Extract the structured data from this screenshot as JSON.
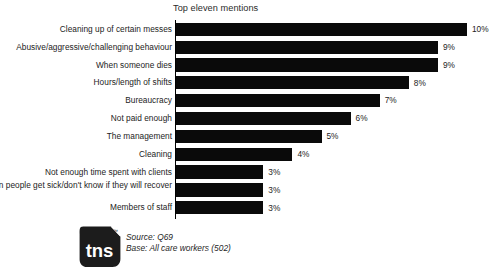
{
  "chart_data": {
    "type": "bar",
    "orientation": "horizontal",
    "title": "Top eleven mentions",
    "xlabel": "",
    "ylabel": "",
    "xlim": [
      0,
      11
    ],
    "grid": false,
    "legend": null,
    "value_suffix": "%",
    "bar_color": "#0a0a0a",
    "categories": [
      "Cleaning up of certain messes",
      "Abusive/aggressive/challenging behaviour",
      "When someone dies",
      "Hours/length of shifts",
      "Bureaucracy",
      "Not paid enough",
      "The management",
      "Cleaning",
      "Not enough time spent with clients",
      "When people get sick/don't know if they will recover",
      "Members of staff"
    ],
    "values": [
      10,
      9,
      9,
      8,
      7,
      6,
      5,
      4,
      3,
      3,
      3
    ],
    "value_labels": [
      "10%",
      "9%",
      "9%",
      "8%",
      "7%",
      "6%",
      "5%",
      "4%",
      "3%",
      "3%",
      "3%"
    ]
  },
  "bars": [
    {
      "label": "Cleaning up of certain messes",
      "value": 10,
      "value_label": "10%",
      "lines": 1
    },
    {
      "label": "Abusive/aggressive/challenging behaviour",
      "value": 9,
      "value_label": "9%",
      "lines": 1
    },
    {
      "label": "When someone dies",
      "value": 9,
      "value_label": "9%",
      "lines": 1
    },
    {
      "label": "Hours/length of shifts",
      "value": 8,
      "value_label": "8%",
      "lines": 1
    },
    {
      "label": "Bureaucracy",
      "value": 7,
      "value_label": "7%",
      "lines": 1
    },
    {
      "label": "Not paid enough",
      "value": 6,
      "value_label": "6%",
      "lines": 1
    },
    {
      "label": "The management",
      "value": 5,
      "value_label": "5%",
      "lines": 1
    },
    {
      "label": "Cleaning",
      "value": 4,
      "value_label": "4%",
      "lines": 1
    },
    {
      "label": "Not enough time spent with clients",
      "value": 3,
      "value_label": "3%",
      "lines": 1
    },
    {
      "label": "When people get sick/don't know if they will recover",
      "value": 3,
      "value_label": "3%",
      "lines": 2
    },
    {
      "label": "Members of staff",
      "value": 3,
      "value_label": "3%",
      "lines": 1
    }
  ],
  "footer": {
    "logo_text": "tns",
    "logo_trademark": "™",
    "source": "Source:  Q69",
    "base": "Base: All care workers (502)"
  }
}
